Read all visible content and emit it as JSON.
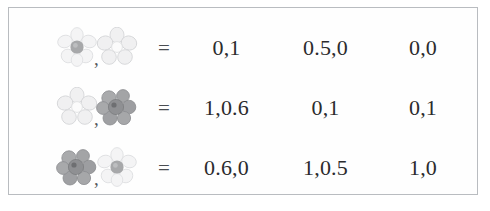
{
  "figure": {
    "type": "payoff-matrix",
    "frame": {
      "border_color": "#b9bcc0",
      "background_color": "#fefefe"
    },
    "equals_symbol": "=",
    "pair_separator": ",",
    "rows": [
      {
        "left_icon": "pale-flower-gray-center-icon",
        "right_icon": "pale-flower-white-center-icon",
        "equals": "=",
        "values": [
          "0,1",
          "0.5,0",
          "0,0"
        ]
      },
      {
        "left_icon": "pale-flower-white-center-icon",
        "right_icon": "dark-flower-cluster-icon",
        "equals": "=",
        "values": [
          "1,0.6",
          "0,1",
          "0,1"
        ]
      },
      {
        "left_icon": "dark-flower-cluster-icon",
        "right_icon": "pale-flower-gray-center-icon",
        "equals": "=",
        "values": [
          "0.6,0",
          "1,0.5",
          "1,0"
        ]
      }
    ],
    "palette": {
      "pale_petal": "#f2f2f3",
      "pale_petal_edge": "#d8d9da",
      "pale_center_gray": "#a7a8aa",
      "pale_center_white": "#fbfbfb",
      "dark_petal": "#a3a4a6",
      "dark_petal_edge": "#87888b",
      "dark_center": "#6e6f72",
      "number_color": "#2b2b2d"
    }
  }
}
